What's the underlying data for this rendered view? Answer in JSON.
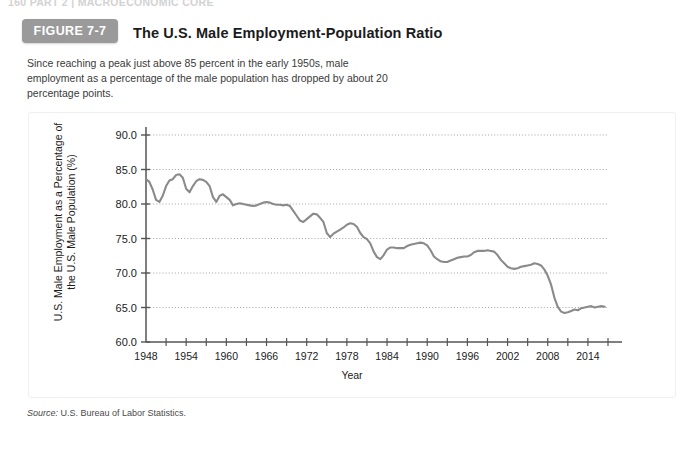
{
  "page": {
    "running_head": "160   PART 2  |  MACROECONOMIC CORE"
  },
  "figure": {
    "badge_label": "FIGURE 7-7",
    "title": "The U.S. Male Employment-Population Ratio",
    "caption": "Since reaching a peak just above 85 percent in the early 1950s, male employment as a percentage of the male population has dropped by about 20 percentage points.",
    "source_prefix": "Source:",
    "source_text": "U.S. Bureau of Labor Statistics."
  },
  "colors": {
    "badge_bg": "#9a9a9a",
    "line": "#8a8a8a",
    "axis": "#555555",
    "grid": "#9a9a9a",
    "card_bg": "#ffffff",
    "text": "#1b1b1b"
  },
  "chart_data": {
    "type": "line",
    "title": "The U.S. Male Employment-Population Ratio",
    "xlabel": "Year",
    "ylabel": "U.S. Male Employment as a Percentage of the U.S. Male Population (%)",
    "xlim": [
      1948,
      2017
    ],
    "ylim": [
      60.0,
      90.0
    ],
    "yticks": [
      60.0,
      65.0,
      70.0,
      75.0,
      80.0,
      85.0,
      90.0
    ],
    "ytick_labels": [
      "60.0",
      "65.0",
      "70.0",
      "75.0",
      "80.0",
      "85.0",
      "90.0"
    ],
    "xticks": [
      1948,
      1954,
      1960,
      1966,
      1972,
      1978,
      1984,
      1990,
      1996,
      2002,
      2008,
      2014
    ],
    "xtick_labels": [
      "1948",
      "1954",
      "1960",
      "1966",
      "1972",
      "1978",
      "1984",
      "1990",
      "1996",
      "2002",
      "2008",
      "2014"
    ],
    "x_minor_tick_step": 3,
    "grid": "horizontal-dotted",
    "legend": null,
    "series": [
      {
        "name": "U.S. Male Employment-Population Ratio",
        "color": "#8a8a8a",
        "x": [
          1948,
          1948.5,
          1949,
          1949.5,
          1950,
          1950.5,
          1951,
          1951.5,
          1952,
          1952.5,
          1953,
          1953.5,
          1954,
          1954.5,
          1955,
          1955.5,
          1956,
          1956.5,
          1957,
          1957.5,
          1958,
          1958.5,
          1959,
          1959.5,
          1960,
          1960.5,
          1961,
          1961.5,
          1962,
          1962.5,
          1963,
          1963.5,
          1964,
          1964.5,
          1965,
          1965.5,
          1966,
          1966.5,
          1967,
          1967.5,
          1968,
          1968.5,
          1969,
          1969.5,
          1970,
          1970.5,
          1971,
          1971.5,
          1972,
          1972.5,
          1973,
          1973.5,
          1974,
          1974.5,
          1975,
          1975.5,
          1976,
          1976.5,
          1977,
          1977.5,
          1978,
          1978.5,
          1979,
          1979.5,
          1980,
          1980.5,
          1981,
          1981.5,
          1982,
          1982.5,
          1983,
          1983.5,
          1984,
          1984.5,
          1985,
          1985.5,
          1986,
          1986.5,
          1987,
          1987.5,
          1988,
          1988.5,
          1989,
          1989.5,
          1990,
          1990.5,
          1991,
          1991.5,
          1992,
          1992.5,
          1993,
          1993.5,
          1994,
          1994.5,
          1995,
          1995.5,
          1996,
          1996.5,
          1997,
          1997.5,
          1998,
          1998.5,
          1999,
          1999.5,
          2000,
          2000.5,
          2001,
          2001.5,
          2002,
          2002.5,
          2003,
          2003.5,
          2004,
          2004.5,
          2005,
          2005.5,
          2006,
          2006.5,
          2007,
          2007.5,
          2008,
          2008.5,
          2009,
          2009.5,
          2010,
          2010.5,
          2011,
          2011.5,
          2012,
          2012.5,
          2013,
          2013.5,
          2014,
          2014.5,
          2015,
          2015.5,
          2016,
          2016.5
        ],
        "y": [
          83.6,
          83.2,
          82.1,
          80.6,
          80.3,
          81.2,
          82.6,
          83.4,
          83.6,
          84.2,
          84.3,
          83.8,
          82.2,
          81.7,
          82.6,
          83.3,
          83.6,
          83.5,
          83.2,
          82.6,
          81.0,
          80.3,
          81.2,
          81.4,
          81.0,
          80.6,
          79.8,
          80.0,
          80.1,
          80.0,
          79.9,
          79.8,
          79.7,
          79.8,
          80.0,
          80.2,
          80.3,
          80.2,
          80.0,
          79.9,
          79.9,
          79.8,
          79.9,
          79.7,
          79.0,
          78.3,
          77.6,
          77.4,
          77.8,
          78.2,
          78.6,
          78.5,
          78.0,
          77.4,
          75.8,
          75.2,
          75.7,
          76.0,
          76.3,
          76.6,
          77.0,
          77.2,
          77.1,
          76.7,
          75.8,
          75.2,
          74.9,
          74.3,
          73.1,
          72.3,
          72.0,
          72.6,
          73.4,
          73.7,
          73.7,
          73.6,
          73.6,
          73.6,
          73.9,
          74.1,
          74.2,
          74.3,
          74.4,
          74.3,
          74.0,
          73.3,
          72.4,
          72.0,
          71.7,
          71.6,
          71.6,
          71.8,
          72.0,
          72.2,
          72.3,
          72.4,
          72.4,
          72.6,
          73.0,
          73.2,
          73.2,
          73.2,
          73.3,
          73.2,
          73.1,
          72.6,
          71.9,
          71.4,
          70.9,
          70.7,
          70.6,
          70.7,
          70.9,
          71.0,
          71.1,
          71.2,
          71.4,
          71.3,
          71.1,
          70.5,
          69.6,
          68.3,
          66.4,
          65.1,
          64.4,
          64.2,
          64.3,
          64.5,
          64.7,
          64.6,
          64.9,
          65.0,
          65.1,
          65.2,
          65.0,
          65.1,
          65.2,
          65.1
        ]
      }
    ],
    "annotations": [
      {
        "text": "peak just above 85 percent in the early 1950s",
        "approx_year": 1953,
        "approx_value": 84.3
      },
      {
        "text": "recession trough",
        "approx_year": 1983,
        "approx_value": 72.0
      },
      {
        "text": "2009 collapse",
        "approx_year": 2010,
        "approx_value": 64.2
      }
    ]
  }
}
